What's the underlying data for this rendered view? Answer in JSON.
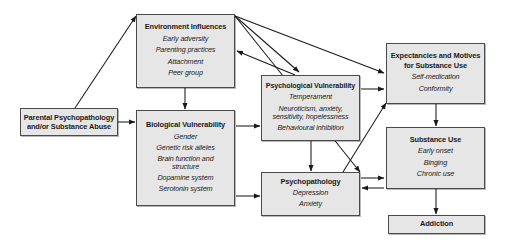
{
  "diagram": {
    "palette": {
      "node_fill": "#e6e6e6",
      "node_border": "#4a4a4a",
      "arrow": "#1a1a1a",
      "background": "#ffffff"
    },
    "nodes": [
      {
        "id": "parental",
        "title": "Parental Psychopathology and/or Substance Abuse",
        "title_lines": [
          "Parental Psychopathology",
          "and/or Substance Abuse"
        ],
        "items": []
      },
      {
        "id": "environment",
        "title": "Environment Influences",
        "items": [
          "Early adversity",
          "Parenting practices",
          "Attachment",
          "Peer group"
        ]
      },
      {
        "id": "biological",
        "title": "Biological Vulnerability",
        "items": [
          "Gender",
          "Genetic risk alleles",
          "Brain function and structure",
          "Dopamine system",
          "Serotonin system"
        ]
      },
      {
        "id": "psychological",
        "title": "Psychological Vulnerability",
        "items": [
          "Temperament",
          "Neuroticism, anxiety, sensitivity, hopelessness",
          "Behavioural inhibition"
        ]
      },
      {
        "id": "psychopathology",
        "title": "Psychopathology",
        "items": [
          "Depression",
          "Anxiety"
        ]
      },
      {
        "id": "expectancies",
        "title": "Expectancies and Motives for Substance Use",
        "title_lines": [
          "Expectancies and Motives",
          "for Substance Use"
        ],
        "items": [
          "Self-medication",
          "Conformity"
        ]
      },
      {
        "id": "substance",
        "title": "Substance Use",
        "items": [
          "Early onset",
          "Binging",
          "Chronic use"
        ]
      },
      {
        "id": "addiction",
        "title": "Addiction",
        "items": []
      }
    ],
    "edges": [
      {
        "from": "parental",
        "to": "environment",
        "style": "diagonal"
      },
      {
        "from": "parental",
        "to": "biological",
        "style": "straight"
      },
      {
        "from": "environment",
        "to": "biological",
        "style": "straight"
      },
      {
        "from": "environment",
        "to": "psychological",
        "style": "diagonal"
      },
      {
        "from": "environment",
        "to": "expectancies",
        "style": "diagonal"
      },
      {
        "from": "environment",
        "to": "psychopathology",
        "style": "diagonal"
      },
      {
        "from": "psychological",
        "to": "environment",
        "style": "diagonal"
      },
      {
        "from": "biological",
        "to": "psychological",
        "style": "straight"
      },
      {
        "from": "biological",
        "to": "psychopathology",
        "style": "straight"
      },
      {
        "from": "psychological",
        "to": "expectancies",
        "style": "straight"
      },
      {
        "from": "psychological",
        "to": "psychopathology",
        "style": "straight"
      },
      {
        "from": "psychopathology",
        "to": "expectancies",
        "style": "diagonal"
      },
      {
        "from": "psychopathology",
        "to": "substance",
        "style": "straight"
      },
      {
        "from": "substance",
        "to": "psychopathology",
        "style": "straight"
      },
      {
        "from": "expectancies",
        "to": "substance",
        "style": "straight"
      },
      {
        "from": "substance",
        "to": "addiction",
        "style": "straight"
      }
    ]
  }
}
